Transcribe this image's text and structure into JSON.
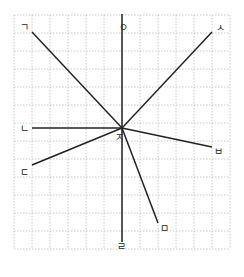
{
  "diagram": {
    "grid": {
      "x0": 14,
      "y0": 15,
      "cols": 12,
      "rows": 13,
      "cell": 18,
      "color": "#bdbdbd"
    },
    "center": {
      "x": 122,
      "y": 128,
      "label": "ㅈ"
    },
    "lines": [
      {
        "id": "giyeok",
        "label": "ㄱ",
        "x": 32,
        "y": 32
      },
      {
        "id": "ieung",
        "label": "ㅇ",
        "x": 122,
        "y": 14
      },
      {
        "id": "siot",
        "label": "ㅅ",
        "x": 212,
        "y": 32
      },
      {
        "id": "nieun",
        "label": "ㄴ",
        "x": 32,
        "y": 128
      },
      {
        "id": "bieup",
        "label": "ㅂ",
        "x": 212,
        "y": 147
      },
      {
        "id": "digeut",
        "label": "ㄷ",
        "x": 32,
        "y": 165
      },
      {
        "id": "mieum",
        "label": "ㅁ",
        "x": 158,
        "y": 223
      },
      {
        "id": "rieul",
        "label": "ㄹ",
        "x": 122,
        "y": 242
      }
    ],
    "labels": {
      "giyeok": "ㄱ",
      "ieung": "ㅇ",
      "siot": "ㅅ",
      "nieun": "ㄴ",
      "bieup": "ㅂ",
      "digeut": "ㄷ",
      "mieum": "ㅁ",
      "rieul": "ㄹ",
      "jieut": "ㅈ"
    }
  }
}
